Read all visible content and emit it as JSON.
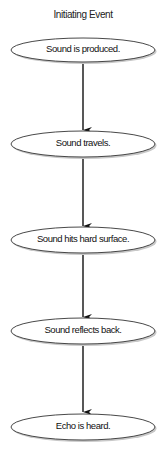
{
  "diagram": {
    "type": "flowchart",
    "title": "Initiating Event",
    "nodes": [
      {
        "id": "n1",
        "label": "Sound is produced.",
        "cy": 50
      },
      {
        "id": "n2",
        "label": "Sound travels.",
        "cy": 144
      },
      {
        "id": "n3",
        "label": "Sound hits hard surface.",
        "cy": 240
      },
      {
        "id": "n4",
        "label": "Sound reflects back.",
        "cy": 331
      },
      {
        "id": "n5",
        "label": "Echo is heard.",
        "cy": 427
      }
    ],
    "edges": [
      {
        "from": "n1",
        "to": "n2"
      },
      {
        "from": "n2",
        "to": "n3"
      },
      {
        "from": "n3",
        "to": "n4"
      },
      {
        "from": "n4",
        "to": "n5"
      }
    ],
    "colors": {
      "node_fill": "#ffffff",
      "node_stroke": "#333333",
      "arrow": "#111111",
      "shadow": "#bbbbbb"
    }
  }
}
